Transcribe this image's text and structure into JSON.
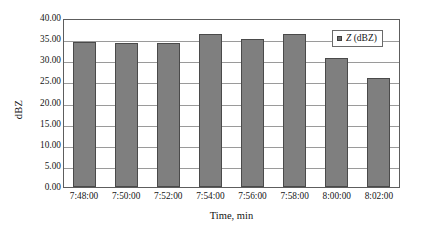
{
  "chart_data": {
    "type": "bar",
    "title": "",
    "xlabel": "Time, min",
    "ylabel": "dBZ",
    "categories": [
      "7:48:00",
      "7:50:00",
      "7:52:00",
      "7:54:00",
      "7:56:00",
      "7:58:00",
      "8:00:00",
      "8:02:00"
    ],
    "values": [
      34.3,
      34.2,
      34.1,
      36.2,
      35.0,
      36.1,
      30.6,
      25.8
    ],
    "series": [
      {
        "name": "Z (dBZ)",
        "values": [
          34.3,
          34.2,
          34.1,
          36.2,
          35.0,
          36.1,
          30.6,
          25.8
        ]
      }
    ],
    "ylim": [
      0,
      40
    ],
    "ytick_step": 5,
    "ytick_labels": [
      "40.00",
      "35.00",
      "30.00",
      "25.00",
      "20.00",
      "15.00",
      "10.00",
      "5.00",
      "0.00"
    ],
    "ytick_values": [
      40,
      35,
      30,
      25,
      20,
      15,
      10,
      5,
      0
    ],
    "grid": "horizontal",
    "legend_position": "top-right",
    "bar_color": "#7f7f7f",
    "bar_border_color": "#4a4a4a",
    "gridline_color": "#9a9a9a",
    "axis_color": "#5d5d5d",
    "background": "#ffffff"
  },
  "legend": {
    "symbol": "Z",
    "unit": "(dBZ)",
    "marker": "legend-swatch"
  }
}
